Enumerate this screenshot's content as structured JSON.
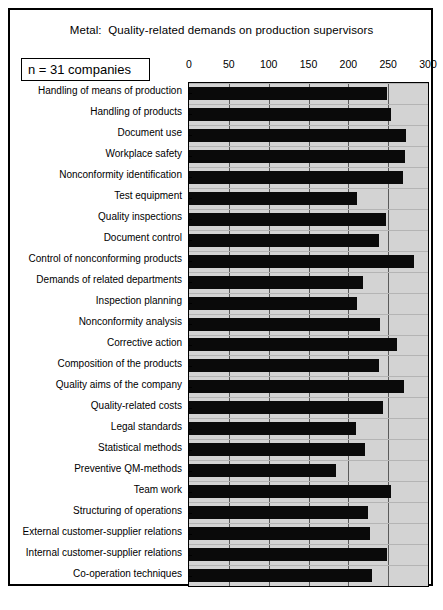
{
  "figure": {
    "title": "Metal:  Quality-related demands on production supervisors",
    "sample_note": "n = 31 companies"
  },
  "chart_data": {
    "type": "bar",
    "orientation": "horizontal",
    "title": "Metal:  Quality-related demands on production supervisors",
    "xlabel": "",
    "ylabel": "",
    "xlim": [
      0,
      300
    ],
    "xticks": [
      0,
      50,
      100,
      150,
      200,
      250,
      300
    ],
    "xtick_labels": [
      "0",
      "50",
      "100",
      "150",
      "200",
      "250",
      "300"
    ],
    "grid": true,
    "legend": null,
    "annotations": [
      "n = 31 companies"
    ],
    "bar_color": "#0a0a0a",
    "plot_background": "#d3d3d3",
    "categories": [
      "Handling of means of production",
      "Handling of products",
      "Document use",
      "Workplace safety",
      "Nonconformity identification",
      "Test equipment",
      "Quality inspections",
      "Document control",
      "Control of nonconforming products",
      "Demands of related departments",
      "Inspection planning",
      "Nonconformity analysis",
      "Corrective action",
      "Composition of the  products",
      "Quality aims of the company",
      "Quality-related costs",
      "Legal standards",
      "Statistical methods",
      "Preventive QM-methods",
      "Team work",
      "Structuring of operations",
      "External customer-supplier relations",
      "Internal customer-supplier relations",
      "Co-operation techniques"
    ],
    "values": [
      249,
      253,
      272,
      271,
      268,
      211,
      247,
      239,
      283,
      219,
      211,
      240,
      261,
      239,
      270,
      244,
      210,
      221,
      185,
      253,
      225,
      227,
      249,
      230
    ]
  }
}
